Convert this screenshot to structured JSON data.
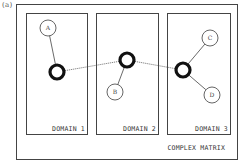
{
  "panel_label": "(a)",
  "title": "COMPLEX MATRIX",
  "colors": {
    "line": "#444444",
    "hub_stroke": "#111111",
    "node_stroke": "#555555",
    "text": "#333333",
    "background": "#ffffff"
  },
  "domains": [
    {
      "label": "DOMAIN 1",
      "left": 26,
      "width": 62
    },
    {
      "label": "DOMAIN 2",
      "left": 96,
      "width": 63
    },
    {
      "label": "DOMAIN 3",
      "left": 167,
      "width": 64
    }
  ],
  "hubs": [
    {
      "id": "hub-1",
      "domain": "DOMAIN 1",
      "cx": 57,
      "cy": 72,
      "r": 7
    },
    {
      "id": "hub-2",
      "domain": "DOMAIN 2",
      "cx": 127,
      "cy": 60,
      "r": 7
    },
    {
      "id": "hub-3",
      "domain": "DOMAIN 3",
      "cx": 183,
      "cy": 70,
      "r": 7
    }
  ],
  "nodes": [
    {
      "id": "A",
      "label": "A",
      "domain": "DOMAIN 1",
      "cx": 48,
      "cy": 28,
      "r": 8,
      "hub": "hub-1"
    },
    {
      "id": "B",
      "label": "B",
      "domain": "DOMAIN 2",
      "cx": 115,
      "cy": 92,
      "r": 8,
      "hub": "hub-2"
    },
    {
      "id": "C",
      "label": "C",
      "domain": "DOMAIN 3",
      "cx": 210,
      "cy": 38,
      "r": 8,
      "hub": "hub-3"
    },
    {
      "id": "D",
      "label": "D",
      "domain": "DOMAIN 3",
      "cx": 212,
      "cy": 95,
      "r": 8,
      "hub": "hub-3"
    }
  ],
  "dotted_links": [
    {
      "from": "hub-1",
      "to": "hub-2"
    },
    {
      "from": "hub-2",
      "to": "hub-3"
    }
  ]
}
